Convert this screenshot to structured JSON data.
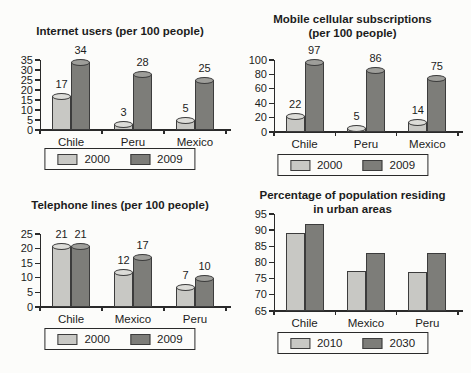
{
  "page": {
    "background": "#fcfcfa"
  },
  "colors": {
    "bar_light_fill": "#c8c8c4",
    "bar_light_cap": "#dcdcd8",
    "bar_dark_fill": "#7d7d79",
    "bar_dark_cap": "#9e9e9a",
    "bar_border": "#3c3c3c",
    "axis": "#2a2a2a",
    "text": "#1c1c1c"
  },
  "chart_data": [
    {
      "type": "bar",
      "title_lines": [
        "Internet users (per 100 people)"
      ],
      "categories": [
        "Chile",
        "Peru",
        "Mexico"
      ],
      "series": [
        {
          "name": "2000",
          "values": [
            17,
            3,
            5
          ]
        },
        {
          "name": "2009",
          "values": [
            34,
            28,
            25
          ]
        }
      ],
      "ylim": [
        0,
        35
      ],
      "ytick_step": 5,
      "bar_style": "cylinder",
      "show_value_labels": true,
      "grid": false,
      "legend_position": "bottom",
      "legend_labels": [
        "2000",
        "2009"
      ]
    },
    {
      "type": "bar",
      "title_lines": [
        "Mobile cellular subscriptions",
        "(per 100 people)"
      ],
      "categories": [
        "Chile",
        "Peru",
        "Mexico"
      ],
      "series": [
        {
          "name": "2000",
          "values": [
            22,
            5,
            14
          ]
        },
        {
          "name": "2009",
          "values": [
            97,
            86,
            75
          ]
        }
      ],
      "ylim": [
        0,
        100
      ],
      "ytick_step": 20,
      "bar_style": "cylinder",
      "show_value_labels": true,
      "grid": false,
      "legend_position": "bottom",
      "legend_labels": [
        "2000",
        "2009"
      ]
    },
    {
      "type": "bar",
      "title_lines": [
        "Telephone lines (per 100 people)"
      ],
      "categories": [
        "Chile",
        "Mexico",
        "Peru"
      ],
      "series": [
        {
          "name": "2000",
          "values": [
            21,
            12,
            7
          ]
        },
        {
          "name": "2009",
          "values": [
            21,
            17,
            10
          ]
        }
      ],
      "ylim": [
        0,
        25
      ],
      "ytick_step": 5,
      "bar_style": "cylinder",
      "show_value_labels": true,
      "grid": false,
      "legend_position": "bottom",
      "legend_labels": [
        "2000",
        "2009"
      ]
    },
    {
      "type": "bar",
      "title_lines": [
        "Percentage of population residing",
        "in urban areas"
      ],
      "categories": [
        "Chile",
        "Mexico",
        "Peru"
      ],
      "series": [
        {
          "name": "2010",
          "values": [
            89,
            77.5,
            77
          ]
        },
        {
          "name": "2030",
          "values": [
            92,
            83,
            83
          ]
        }
      ],
      "ylim": [
        65,
        95
      ],
      "ytick_step": 5,
      "bar_style": "flat",
      "show_value_labels": false,
      "grid": false,
      "legend_position": "bottom",
      "legend_labels": [
        "2010",
        "2030"
      ]
    }
  ]
}
